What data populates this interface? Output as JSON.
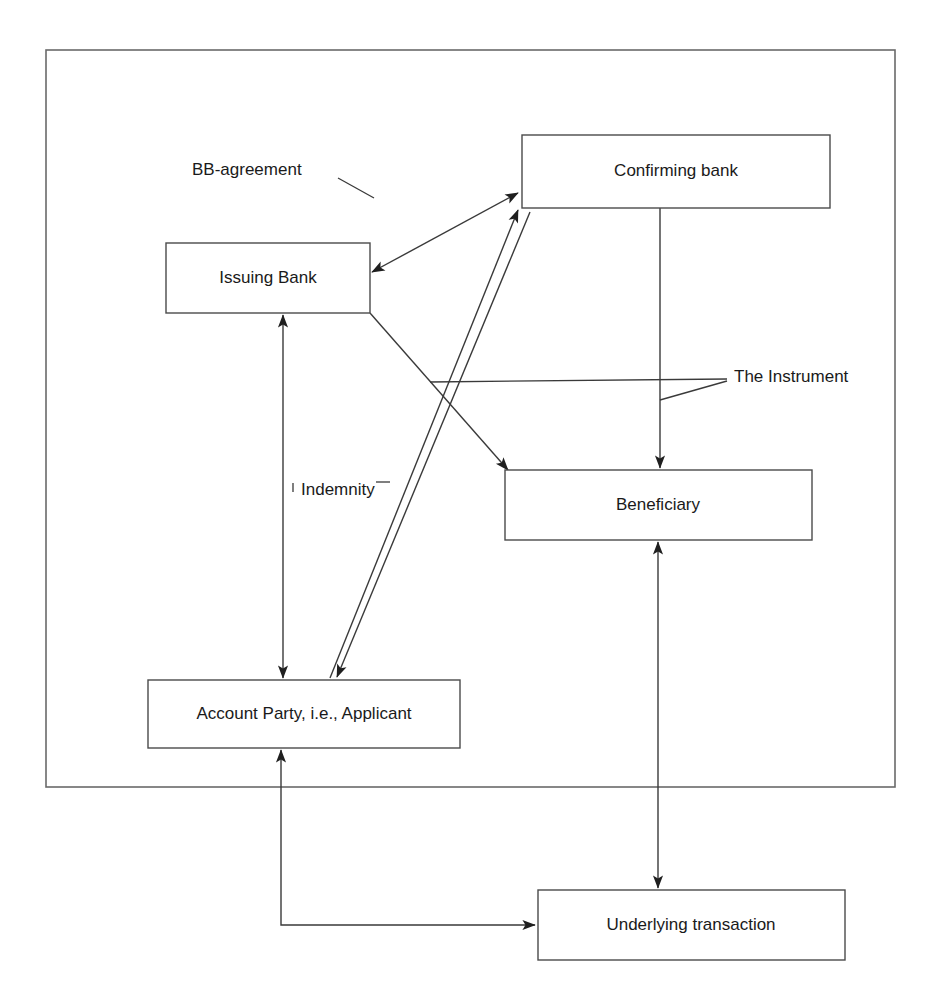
{
  "figure": {
    "type": "flow-diagram",
    "background_color": "#ffffff",
    "line_color": "#3a3a3a",
    "frame": {
      "name": "outer-frame",
      "x": 46,
      "y": 50,
      "width": 849,
      "height": 737
    },
    "caption": ""
  },
  "nodes": [
    {
      "id": "confirming-bank",
      "label": "Confirming bank",
      "x": 522,
      "y": 135,
      "width": 308,
      "height": 73
    },
    {
      "id": "issuing-bank",
      "label": "Issuing Bank",
      "x": 166,
      "y": 243,
      "width": 204,
      "height": 70
    },
    {
      "id": "beneficiary",
      "label": "Beneficiary",
      "x": 505,
      "y": 470,
      "width": 307,
      "height": 70
    },
    {
      "id": "account-party",
      "label": "Account Party, i.e., Applicant",
      "x": 148,
      "y": 680,
      "width": 312,
      "height": 68
    },
    {
      "id": "underlying-transaction",
      "label": "Underlying transaction",
      "x": 538,
      "y": 890,
      "width": 307,
      "height": 70
    }
  ],
  "annotations": [
    {
      "id": "bb-agreement",
      "label": "BB-agreement",
      "text_x": 192,
      "text_y": 171,
      "leader": "M 338 178 L 374 198"
    },
    {
      "id": "indemnity",
      "label": "Indemnity",
      "text_x": 300,
      "text_y": 491,
      "tick_left": "M 292 481 L 292 492 L 300 492",
      "tick_right": "M 377 481 L 389 481"
    },
    {
      "id": "the-instrument",
      "label": "The Instrument",
      "text_x": 736,
      "text_y": 378,
      "leader_horizontal": "M 430 382 L 727 379",
      "leader_diagonal": "M 660 400 L 727 381"
    }
  ],
  "connectors": [
    {
      "id": "issuing-confirming-bidirectional",
      "from": "issuing-bank",
      "to": "confirming-bank",
      "relation": "BB-agreement",
      "arrows": "both",
      "path": "M 372 272 L 518 193"
    },
    {
      "id": "issuing-to-beneficiary",
      "from": "issuing-bank",
      "to": "beneficiary",
      "relation": "The Instrument",
      "arrows": "end",
      "path": "M 370 313 L 508 470"
    },
    {
      "id": "account-party-to-confirming",
      "from": "account-party",
      "to": "confirming-bank",
      "arrows": "end",
      "path": "M 330 678 L 518 210"
    },
    {
      "id": "confirming-to-account-party",
      "from": "confirming-bank",
      "to": "account-party",
      "arrows": "end",
      "path": "M 530 212 L 337 677"
    },
    {
      "id": "confirming-to-beneficiary",
      "from": "confirming-bank",
      "to": "beneficiary",
      "relation": "The Instrument",
      "arrows": "end",
      "path": "M 660 208 L 660 468"
    },
    {
      "id": "indemnity-bidirectional",
      "from": "account-party",
      "to": "issuing-bank",
      "relation": "Indemnity",
      "arrows": "both",
      "path": "M 283 678 L 283 315"
    },
    {
      "id": "beneficiary-underlying-bidirectional",
      "from": "beneficiary",
      "to": "underlying-transaction",
      "arrows": "both",
      "path": "M 658 542 L 658 888"
    },
    {
      "id": "account-party-to-underlying",
      "from": "account-party",
      "to": "underlying-transaction",
      "arrows": "both",
      "path": "M 281 750 L 281 925 L 535 925"
    }
  ]
}
